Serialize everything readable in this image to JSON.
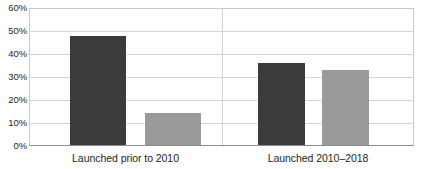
{
  "chart_data": {
    "type": "bar",
    "title": "",
    "subtitle": "",
    "xlabel": "",
    "ylabel": "",
    "categories": [
      "Launched prior to 2010",
      "Launched 2010–2018"
    ],
    "series": [
      {
        "name": "Series 1",
        "color": "#3b3b3b",
        "values": [
          48,
          36
        ]
      },
      {
        "name": "Series 2",
        "color": "#9a9a9a",
        "values": [
          14,
          33
        ]
      }
    ],
    "ylim": [
      0,
      60
    ],
    "y_tick_step": 10,
    "y_tick_labels": [
      "60%",
      "50%",
      "40%",
      "30%",
      "20%",
      "10%",
      "0%"
    ],
    "y_tick_values": [
      60,
      50,
      40,
      30,
      20,
      10,
      0
    ],
    "value_format": "percent",
    "grid": true,
    "grid_axis": "y",
    "legend": false,
    "legend_position": "none",
    "annotations": [],
    "colors": {
      "series_dark": "#3b3b3b",
      "series_light": "#9a9a9a",
      "gridline": "#d3d3d3",
      "axis": "#8d8d8d",
      "text": "#231f20",
      "background": "#ffffff"
    }
  }
}
